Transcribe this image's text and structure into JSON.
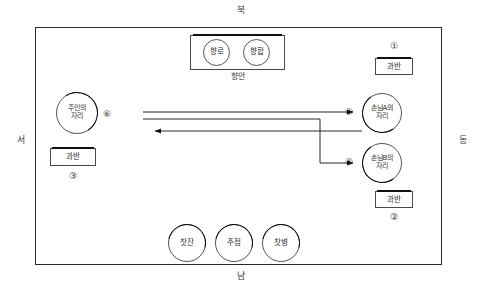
{
  "diagram": {
    "compass": {
      "north": "북",
      "south": "남",
      "west": "서",
      "east": "동"
    },
    "incense_table": {
      "label": "향안",
      "censer": "향로",
      "incense_box": "향합"
    },
    "seats": {
      "host": "주인의\n자리",
      "host_line1": "주인의",
      "host_line2": "자리",
      "guest_a_line1": "손님A의",
      "guest_a_line2": "자리",
      "guest_b_line1": "손님B의",
      "guest_b_line2": "자리"
    },
    "trays": {
      "tray_1": "과반",
      "tray_2": "과반",
      "tray_3": "과반"
    },
    "vessels": {
      "teacup": "찻잔",
      "pot": "주점",
      "teabottle": "찻병"
    },
    "numbers": {
      "n1": "①",
      "n2": "②",
      "n3": "③",
      "n4": "④",
      "n5": "⑤",
      "n6": "⑥"
    },
    "colors": {
      "frame": "#2b2b2b",
      "accent_arc": "#0d0d0d",
      "text": "#2f2f2f",
      "background": "#ffffff"
    },
    "flows": [
      {
        "id": "host-to-guest-a",
        "from": "주인의 자리",
        "to": "손님A의 자리",
        "direction": "east"
      },
      {
        "id": "host-to-guest-b",
        "from": "주인의 자리",
        "to": "손님B의 자리",
        "direction": "east-then-south"
      },
      {
        "id": "guest-to-host",
        "from": "손님 자리",
        "to": "주인의 자리",
        "direction": "west"
      }
    ]
  }
}
